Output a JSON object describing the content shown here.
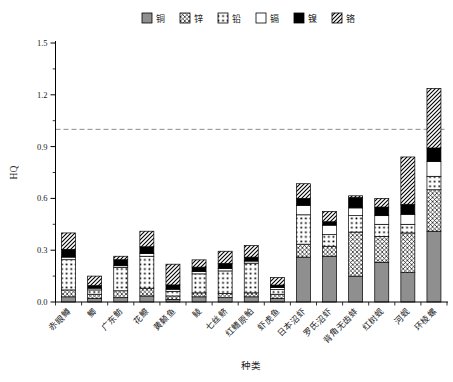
{
  "figure": {
    "background": "#ffffff",
    "x_axis_title": "种类",
    "y_axis_title": "HQ"
  },
  "chart_data": {
    "type": "bar",
    "stacked": true,
    "title": "",
    "xlabel": "种类",
    "ylabel": "HQ",
    "ylim": [
      0,
      1.5
    ],
    "yticks": [
      "0.0",
      "0.3",
      "0.6",
      "0.9",
      "1.2",
      "1.5"
    ],
    "minor_ytick_step": 0.15,
    "grid": false,
    "legend_position": "top",
    "reference_line": {
      "value": 1.0,
      "style": "dashed",
      "color": "#8c8c8c"
    },
    "categories": [
      "赤眼鳟",
      "鲫",
      "广东鲂",
      "花鰶",
      "黄颡鱼",
      "鲮",
      "七丝鲚",
      "红鳍原鲌",
      "虾虎鱼",
      "日本沼虾",
      "罗氏沼虾",
      "背角无齿蚌",
      "红树蚬",
      "河蚬",
      "环棱螺"
    ],
    "series": [
      {
        "name": "铜",
        "pattern": "solid-gray",
        "color": "#8f8f8f",
        "values": [
          0.03,
          0.02,
          0.025,
          0.035,
          0.015,
          0.03,
          0.025,
          0.03,
          0.02,
          0.26,
          0.265,
          0.15,
          0.23,
          0.17,
          0.41
        ]
      },
      {
        "name": "锌",
        "pattern": "crosshatch",
        "color": "#000000",
        "values": [
          0.04,
          0.025,
          0.04,
          0.045,
          0.02,
          0.023,
          0.025,
          0.023,
          0.025,
          0.075,
          0.058,
          0.255,
          0.15,
          0.23,
          0.24
        ]
      },
      {
        "name": "铅",
        "pattern": "dot-grid",
        "color": "#000000",
        "values": [
          0.175,
          0.025,
          0.135,
          0.185,
          0.027,
          0.11,
          0.13,
          0.172,
          0.027,
          0.17,
          0.067,
          0.095,
          0.07,
          0.05,
          0.078
        ]
      },
      {
        "name": "镉",
        "pattern": "white",
        "color": "#ffffff",
        "values": [
          0.015,
          0.01,
          0.01,
          0.015,
          0.012,
          0.014,
          0.014,
          0.012,
          0.012,
          0.055,
          0.055,
          0.045,
          0.05,
          0.058,
          0.086
        ]
      },
      {
        "name": "镍",
        "pattern": "solid-black",
        "color": "#000000",
        "values": [
          0.045,
          0.015,
          0.035,
          0.04,
          0.025,
          0.025,
          0.03,
          0.023,
          0.014,
          0.04,
          0.02,
          0.06,
          0.05,
          0.058,
          0.078
        ]
      },
      {
        "name": "铬",
        "pattern": "diagonal",
        "color": "#000000",
        "values": [
          0.095,
          0.055,
          0.02,
          0.09,
          0.12,
          0.042,
          0.07,
          0.067,
          0.044,
          0.085,
          0.06,
          0.01,
          0.05,
          0.274,
          0.345
        ]
      }
    ],
    "totals": [
      0.4,
      0.15,
      0.265,
      0.41,
      0.219,
      0.244,
      0.294,
      0.327,
      0.142,
      0.685,
      0.525,
      0.615,
      0.6,
      0.84,
      1.237
    ]
  }
}
